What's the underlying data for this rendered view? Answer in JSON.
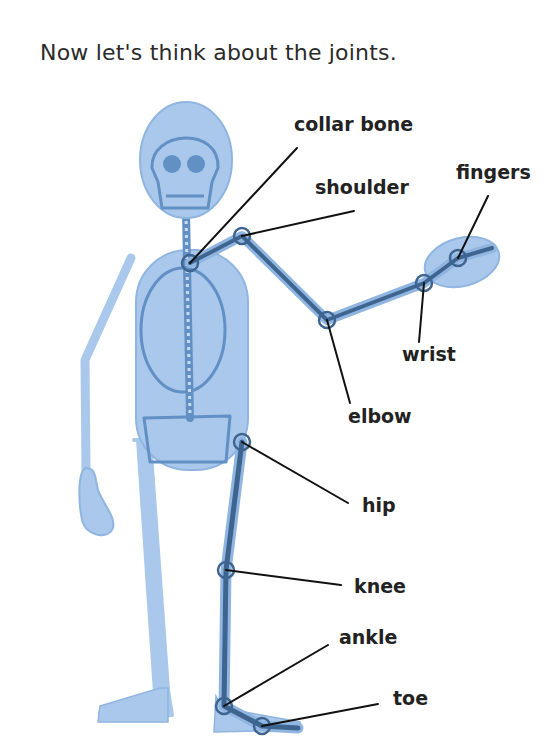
{
  "heading": "Now let's think about the joints.",
  "colors": {
    "body_fill": "#a9c8eb",
    "body_outline": "#8fb5e0",
    "bone": "#6390c4",
    "joint_line": "#3e6490",
    "pointer": "#111111",
    "text": "#222222"
  },
  "labels": {
    "collar_bone": "collar bone",
    "shoulder": "shoulder",
    "fingers": "fingers",
    "wrist": "wrist",
    "elbow": "elbow",
    "hip": "hip",
    "knee": "knee",
    "ankle": "ankle",
    "toe": "toe"
  }
}
